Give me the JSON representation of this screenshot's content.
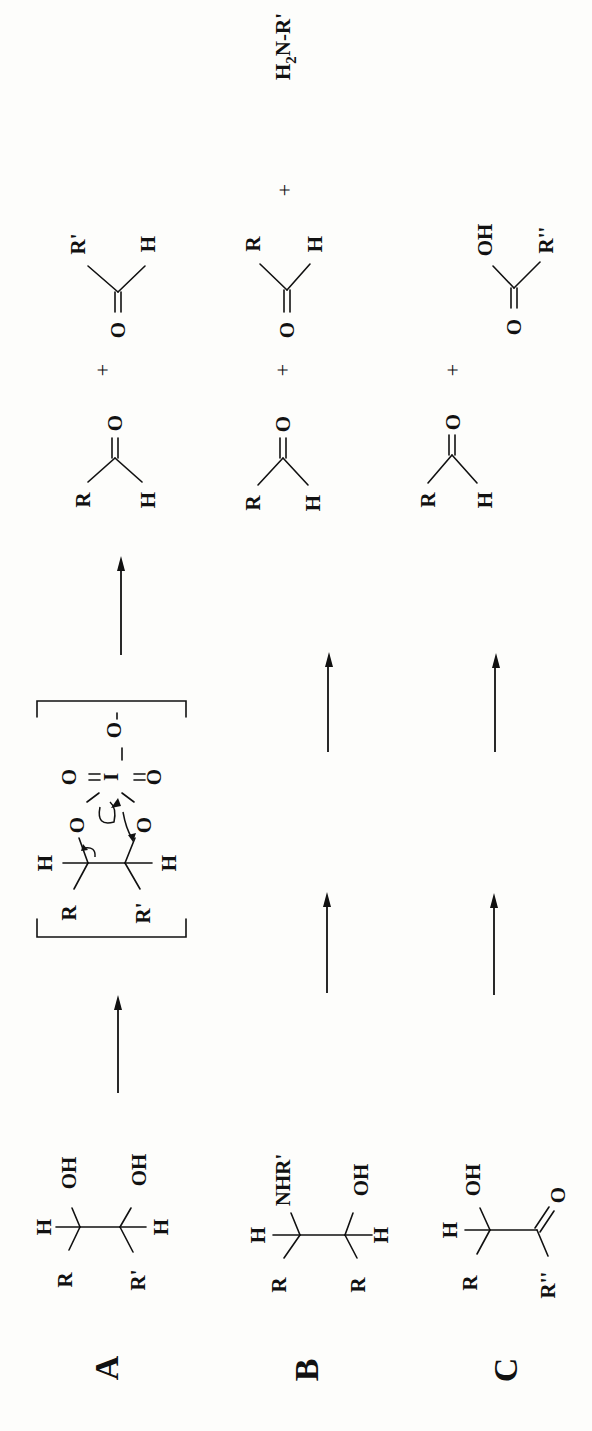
{
  "figure": {
    "orientation": "rotated-90-ccw",
    "rows": [
      {
        "id": "A",
        "label": "A",
        "reactant": {
          "name": "1,2-diol",
          "substituents": {
            "c1": [
              "H",
              "R",
              "OH"
            ],
            "c2": [
              "H",
              "R'",
              "OH"
            ]
          }
        },
        "intermediate": {
          "name": "cyclic periodate ester",
          "atoms": [
            "O",
            "O",
            "I",
            "O",
            "O",
            "O-"
          ],
          "substituents": [
            "H",
            "R",
            "H",
            "R'"
          ]
        },
        "products": [
          {
            "name": "aldehyde",
            "groups": [
              "R",
              "H",
              "O"
            ]
          },
          {
            "name": "aldehyde",
            "groups": [
              "R'",
              "H",
              "O"
            ]
          }
        ],
        "plus_signs": [
          "+"
        ]
      },
      {
        "id": "B",
        "label": "B",
        "reactant": {
          "name": "1,2-amino alcohol",
          "substituents": {
            "c1": [
              "H",
              "R",
              "NHR'"
            ],
            "c2": [
              "H",
              "R",
              "OH"
            ]
          }
        },
        "products": [
          {
            "name": "aldehyde",
            "groups": [
              "R",
              "H",
              "O"
            ]
          },
          {
            "name": "aldehyde",
            "groups": [
              "R",
              "H",
              "O"
            ]
          },
          {
            "name": "amine",
            "text_main": "H",
            "text_sub": "2",
            "text_tail": "N-R'"
          }
        ],
        "plus_signs": [
          "+",
          "+"
        ]
      },
      {
        "id": "C",
        "label": "C",
        "reactant": {
          "name": "alpha-hydroxy ketone",
          "substituents": {
            "c1": [
              "H",
              "R",
              "OH"
            ],
            "c2": [
              "R''",
              "O"
            ]
          }
        },
        "products": [
          {
            "name": "aldehyde",
            "groups": [
              "R",
              "H",
              "O"
            ]
          },
          {
            "name": "carboxylic acid",
            "groups": [
              "OH",
              "R''",
              "O"
            ]
          }
        ],
        "plus_signs": [
          "+"
        ]
      }
    ],
    "text": {
      "H": "H",
      "R": "R",
      "R1": "R'",
      "R2": "R''",
      "OH": "OH",
      "O": "O",
      "NHR1": "NHR'",
      "I": "I",
      "Ominus": "O",
      "minus": "-",
      "plus": "+",
      "amine_H": "H",
      "amine_sub": "2",
      "amine_tail": "N-R'"
    }
  }
}
